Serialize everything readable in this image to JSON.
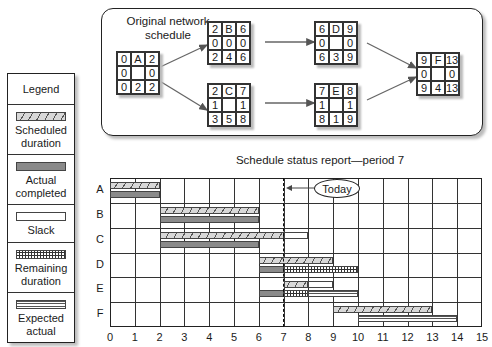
{
  "network": {
    "title": "Original network schedule",
    "nodes": [
      {
        "id": "A",
        "cells": [
          "0",
          "A",
          "2",
          "0",
          "",
          "0",
          "0",
          "2",
          "2"
        ]
      },
      {
        "id": "B",
        "cells": [
          "2",
          "B",
          "6",
          "0",
          "0",
          "0",
          "2",
          "4",
          "6"
        ]
      },
      {
        "id": "C",
        "cells": [
          "2",
          "C",
          "7",
          "1",
          "",
          "1",
          "3",
          "5",
          "8"
        ]
      },
      {
        "id": "D",
        "cells": [
          "6",
          "D",
          "9",
          "0",
          "",
          "0",
          "6",
          "3",
          "9"
        ]
      },
      {
        "id": "E",
        "cells": [
          "7",
          "E",
          "8",
          "1",
          "",
          "1",
          "8",
          "1",
          "9"
        ]
      },
      {
        "id": "F",
        "cells": [
          "9",
          "F",
          "13",
          "0",
          "",
          "0",
          "9",
          "4",
          "13"
        ]
      }
    ],
    "edges": [
      [
        "A",
        "B"
      ],
      [
        "A",
        "C"
      ],
      [
        "B",
        "D"
      ],
      [
        "C",
        "E"
      ],
      [
        "D",
        "F"
      ],
      [
        "E",
        "F"
      ]
    ]
  },
  "legend": {
    "title": "Legend",
    "items": [
      {
        "key": "sched",
        "label": "Scheduled duration"
      },
      {
        "key": "actual",
        "label": "Actual completed"
      },
      {
        "key": "slack",
        "label": "Slack"
      },
      {
        "key": "remain",
        "label": "Remaining duration"
      },
      {
        "key": "expected",
        "label": "Expected actual"
      }
    ]
  },
  "chart_data": {
    "type": "gantt",
    "title": "Schedule status report—period 7",
    "x_ticks": [
      "0",
      "1",
      "2",
      "3",
      "4",
      "5",
      "6",
      "7",
      "8",
      "9",
      "10",
      "11",
      "12",
      "13",
      "14",
      "15"
    ],
    "xlim": [
      0,
      15
    ],
    "today": 7,
    "today_label": "Today",
    "rows": [
      {
        "task": "A",
        "scheduled": [
          0,
          2
        ],
        "slack": null,
        "actual": [
          0,
          2
        ],
        "remaining": null,
        "expected": null
      },
      {
        "task": "B",
        "scheduled": [
          2,
          6
        ],
        "slack": null,
        "actual": [
          2,
          6
        ],
        "remaining": null,
        "expected": null
      },
      {
        "task": "C",
        "scheduled": [
          2,
          7
        ],
        "slack": [
          7,
          8
        ],
        "actual": [
          2,
          6
        ],
        "remaining": null,
        "expected": null
      },
      {
        "task": "D",
        "scheduled": [
          6,
          9
        ],
        "slack": null,
        "actual": [
          6,
          7
        ],
        "remaining": [
          7,
          10
        ],
        "expected": null
      },
      {
        "task": "E",
        "scheduled": [
          7,
          8
        ],
        "slack": [
          8,
          9
        ],
        "actual": [
          6,
          7
        ],
        "remaining": [
          7,
          8
        ],
        "expected": [
          8,
          10
        ]
      },
      {
        "task": "F",
        "scheduled": [
          9,
          13
        ],
        "slack": null,
        "actual": null,
        "remaining": null,
        "expected": [
          10,
          14
        ]
      }
    ]
  }
}
